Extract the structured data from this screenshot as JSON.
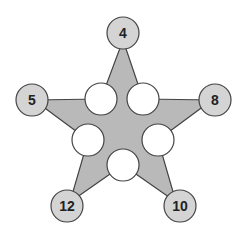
{
  "colors": {
    "star_fill": "#b9b9b9",
    "outer_circle_fill": "#d4d4d4",
    "inner_circle_fill": "#ffffff",
    "stroke": "#444444",
    "text": "#222222"
  },
  "outer_circles": [
    {
      "id": "top",
      "label": "4"
    },
    {
      "id": "left",
      "label": "5"
    },
    {
      "id": "right",
      "label": "8"
    },
    {
      "id": "bottom-left",
      "label": "12"
    },
    {
      "id": "bottom-right",
      "label": "10"
    }
  ],
  "inner_circles": [
    {
      "id": "upper-left",
      "label": ""
    },
    {
      "id": "upper-right",
      "label": ""
    },
    {
      "id": "middle-left",
      "label": ""
    },
    {
      "id": "middle-right",
      "label": ""
    },
    {
      "id": "bottom",
      "label": ""
    }
  ]
}
